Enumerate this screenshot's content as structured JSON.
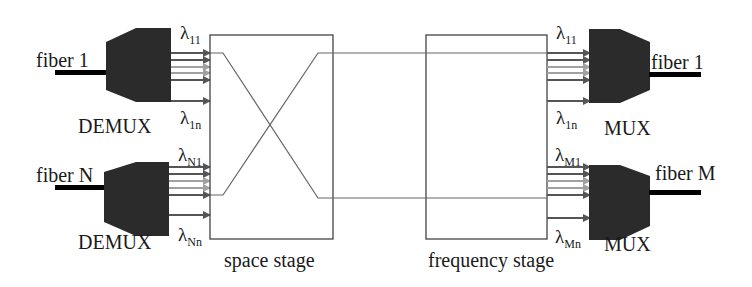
{
  "diagram": {
    "inputs": [
      {
        "fiber_label": "fiber 1",
        "device_label": "DEMUX",
        "lambda_top": {
          "symbol": "λ",
          "sub": "11"
        },
        "lambda_bottom": {
          "symbol": "λ",
          "sub": "1n"
        }
      },
      {
        "fiber_label": "fiber N",
        "device_label": "DEMUX",
        "lambda_top": {
          "symbol": "λ",
          "sub": "N1"
        },
        "lambda_bottom": {
          "symbol": "λ",
          "sub": "Nn"
        }
      }
    ],
    "stages": [
      {
        "label": "space stage"
      },
      {
        "label": "frequency stage"
      }
    ],
    "outputs": [
      {
        "fiber_label": "fiber 1",
        "device_label": "MUX",
        "lambda_top": {
          "symbol": "λ",
          "sub": "11"
        },
        "lambda_bottom": {
          "symbol": "λ",
          "sub": "1n"
        }
      },
      {
        "fiber_label": "fiber M",
        "device_label": "MUX",
        "lambda_top": {
          "symbol": "λ",
          "sub": "M1"
        },
        "lambda_bottom": {
          "symbol": "λ",
          "sub": "Mn"
        }
      }
    ],
    "colors": {
      "device_body": "#2b2b2b",
      "line": "#555555",
      "arrow_dark": "#555555",
      "arrow_light": "#9a9a9a",
      "fiber": "#000000"
    }
  }
}
